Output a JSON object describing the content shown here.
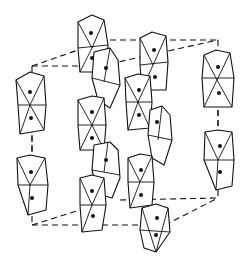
{
  "figure": {
    "colors": {
      "line": "#111111",
      "background": "#ffffff"
    },
    "unit_cell": {
      "style": "dashed",
      "front_face": [
        [
          22,
          80
        ],
        [
          138,
          80
        ],
        [
          138,
          265
        ],
        [
          22,
          265
        ]
      ],
      "top_back_edge": [
        [
          75,
          55
        ],
        [
          205,
          55
        ]
      ]
    },
    "octahedral_columns": [
      {
        "id": "left",
        "x_center": 33,
        "octahedra": 2,
        "segments": 2
      },
      {
        "id": "center-left",
        "x_center": 95,
        "octahedra": 6
      },
      {
        "id": "center-right",
        "x_center": 145,
        "octahedra": 6
      },
      {
        "id": "right",
        "x_center": 218,
        "octahedra": 2,
        "segments": 2
      }
    ]
  }
}
